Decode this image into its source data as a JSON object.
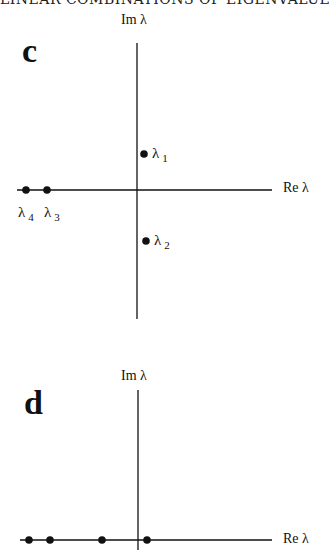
{
  "header": {
    "text": "LINEAR COMBINATIONS OF EIGENVALUES"
  },
  "panels": [
    {
      "letter": "c",
      "im_axis_label": "Im λ",
      "re_axis_label": "Re λ",
      "eigenvalues": [
        {
          "name": "λ",
          "index": "1",
          "position": "upper, just right of imaginary axis"
        },
        {
          "name": "λ",
          "index": "2",
          "position": "lower, just right of imaginary axis"
        },
        {
          "name": "λ",
          "index": "3",
          "position": "on real axis, negative"
        },
        {
          "name": "λ",
          "index": "4",
          "position": "on real axis, most negative"
        }
      ]
    },
    {
      "letter": "d",
      "im_axis_label": "Im λ",
      "re_axis_label": "Re λ",
      "eigenvalues_count": 4
    }
  ],
  "labels": {
    "l1_sym": "λ",
    "l1_idx": "1",
    "l2_sym": "λ",
    "l2_idx": "2",
    "l3_sym": "λ",
    "l3_idx": "3",
    "l4_sym": "λ",
    "l4_idx": "4"
  }
}
